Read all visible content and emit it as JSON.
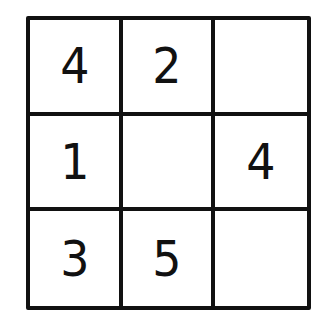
{
  "puzzle": {
    "rows": 3,
    "cols": 3,
    "cells": [
      [
        "4",
        "2",
        ""
      ],
      [
        "1",
        "",
        "4"
      ],
      [
        "3",
        "5",
        ""
      ]
    ]
  }
}
